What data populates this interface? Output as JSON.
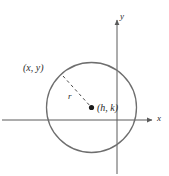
{
  "figure": {
    "name": "circle-standard-form-diagram",
    "background_color": "#ffffff",
    "stroke_color": "#6e6e6e",
    "axis_color": "#5a5a5a",
    "label_color": "#2b2b2b",
    "point_color": "#1a1a1a"
  },
  "axes": {
    "x_label": "x",
    "y_label": "y",
    "x_axis": {
      "y": 120,
      "x_start": 2,
      "x_end": 155
    },
    "y_axis": {
      "x": 117,
      "y_start": 18,
      "y_end": 174
    }
  },
  "circle": {
    "center_x": 91.5,
    "center_y": 107.5,
    "radius": 45
  },
  "labels": {
    "point_on_circle": "(x, y)",
    "center_point": "(h, k)",
    "radius": "r"
  },
  "radius_segment": {
    "from_x": 63,
    "from_y": 76,
    "to_x": 91.5,
    "to_y": 107.5,
    "dash": "3 3"
  },
  "center_marker": {
    "x": 91.5,
    "y": 107.5,
    "size": 2.6
  }
}
